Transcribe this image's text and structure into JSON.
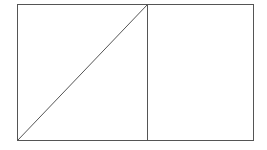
{
  "diagram": {
    "stroke_color": "#555555",
    "background": "#ffffff",
    "outer_rect": {
      "x": 17,
      "y": 4,
      "width": 236,
      "height": 136
    },
    "divider": {
      "x": 147,
      "y1": 4,
      "y2": 140
    },
    "diagonal": {
      "x1": 17,
      "y1": 140,
      "x2": 147,
      "y2": 4
    }
  }
}
